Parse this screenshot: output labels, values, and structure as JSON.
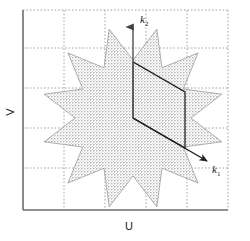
{
  "figure": {
    "type": "reciprocal-space-diagram",
    "axes": {
      "x_label": "U",
      "y_label": "V",
      "frame": {
        "x0": 23,
        "y0": 10,
        "x1": 228,
        "y1": 210
      },
      "grid": {
        "visible": true,
        "style": "dotted",
        "color": "#999999",
        "x_gridlines": [
          64,
          105,
          146,
          187
        ],
        "y_gridlines": [
          48,
          88,
          128,
          168
        ]
      }
    },
    "vectors": [
      {
        "name": "k2",
        "label": "k",
        "subscript": "2",
        "from": [
          133,
          118
        ],
        "to": [
          133,
          24
        ],
        "label_pos": [
          140,
          20
        ],
        "direction": "up",
        "color": "#555555"
      },
      {
        "name": "k1",
        "label": "k",
        "subscript": "1",
        "from": [
          133,
          118
        ],
        "to": [
          210,
          163
        ],
        "label_pos": [
          214,
          170
        ],
        "direction": "down-right",
        "color": "#222222"
      }
    ],
    "unit_cell": {
      "name": "reciprocal-unit-cell-parallelogram",
      "points": [
        [
          133,
          118
        ],
        [
          133,
          62
        ],
        [
          185,
          92
        ],
        [
          185,
          148
        ]
      ],
      "stroke": "#222222"
    },
    "region": {
      "name": "twelve-pointed-star-region",
      "fill_pattern": "stipple-dots",
      "fill_color": "#a8a8a8",
      "outline_color": "#8c8c8c",
      "center": [
        133,
        118
      ],
      "outer_radius": 92,
      "inner_radius": 58,
      "points": 12,
      "rotation_deg": 15
    },
    "colors": {
      "frame": "#6e6e6e",
      "grid": "#9a9a9a",
      "shade": "#a8a8a8",
      "ink": "#1a1a1a"
    }
  }
}
